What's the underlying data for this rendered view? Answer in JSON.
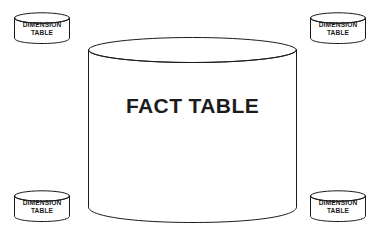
{
  "diagram": {
    "type": "star-schema",
    "background_color": "#ffffff",
    "stroke_color": "#1a1a1a",
    "text_color": "#1c1c1c",
    "shape_fill": "#ffffff",
    "fact": {
      "label": "FACT TABLE",
      "shape": "cylinder",
      "position": "center"
    },
    "dimensions": [
      {
        "id": "top-left",
        "position": "top-left",
        "shape": "cylinder",
        "label_line1": "DIMENSION",
        "label_line2": "TABLE",
        "label": "DIMENSION TABLE"
      },
      {
        "id": "top-right",
        "position": "top-right",
        "shape": "cylinder",
        "label_line1": "DIMENSION",
        "label_line2": "TABLE",
        "label": "DIMENSION TABLE"
      },
      {
        "id": "bottom-left",
        "position": "bottom-left",
        "shape": "cylinder",
        "label_line1": "DIMENSION",
        "label_line2": "TABLE",
        "label": "DIMENSION TABLE"
      },
      {
        "id": "bottom-right",
        "position": "bottom-right",
        "shape": "cylinder",
        "label_line1": "DIMENSION",
        "label_line2": "TABLE",
        "label": "DIMENSION TABLE"
      }
    ]
  }
}
